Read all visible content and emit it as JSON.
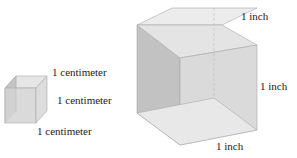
{
  "small_cube": {
    "label_top": "1 centimeter",
    "label_right": "1 centimeter",
    "label_bottom": "1 centimeter"
  },
  "large_cube": {
    "label_top": "1 inch",
    "label_right": "1 inch",
    "label_bottom": "1 inch"
  }
}
